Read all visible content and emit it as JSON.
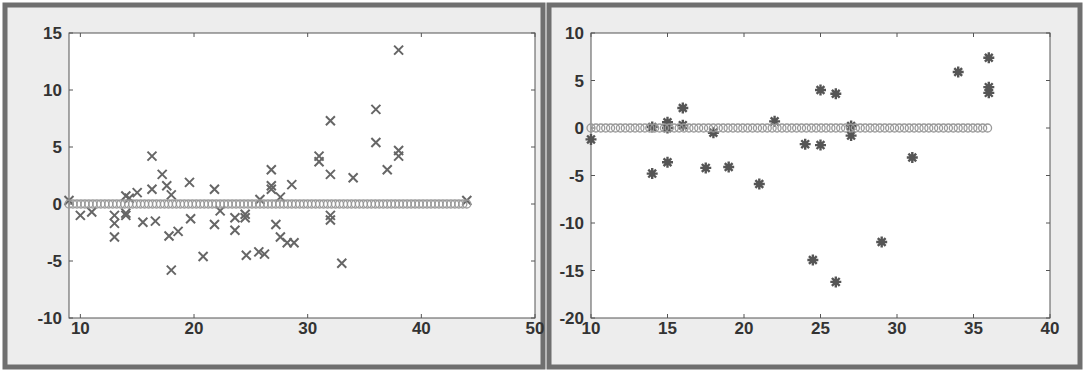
{
  "chart_data": [
    {
      "type": "scatter",
      "title": "",
      "xlabel": "",
      "ylabel": "",
      "xlim": [
        9,
        50
      ],
      "ylim": [
        -10,
        15
      ],
      "xticks": [
        10,
        20,
        30,
        40,
        50
      ],
      "yticks": [
        15,
        10,
        5,
        0,
        -5,
        -10
      ],
      "grid": false,
      "legend": null,
      "series": [
        {
          "name": "residuals",
          "marker": "x",
          "color": "#666666",
          "points": [
            [
              9,
              0.3
            ],
            [
              10,
              -1.0
            ],
            [
              11,
              -0.7
            ],
            [
              13,
              -1.0
            ],
            [
              13,
              -1.7
            ],
            [
              13,
              -2.9
            ],
            [
              14,
              0.7
            ],
            [
              14,
              -0.8
            ],
            [
              14,
              -1.0
            ],
            [
              14.3,
              0.5
            ],
            [
              15,
              1.0
            ],
            [
              15.5,
              -1.6
            ],
            [
              16.3,
              4.2
            ],
            [
              16.3,
              1.3
            ],
            [
              16.6,
              -1.5
            ],
            [
              17.2,
              2.6
            ],
            [
              17.6,
              1.6
            ],
            [
              18,
              0.8
            ],
            [
              17.8,
              -2.8
            ],
            [
              18,
              -5.8
            ],
            [
              18.6,
              -2.4
            ],
            [
              19.6,
              1.9
            ],
            [
              19.7,
              -1.3
            ],
            [
              20.8,
              -4.6
            ],
            [
              21.8,
              1.3
            ],
            [
              21.8,
              -1.8
            ],
            [
              22.3,
              -0.6
            ],
            [
              23.6,
              -1.2
            ],
            [
              23.6,
              -2.3
            ],
            [
              24.5,
              -0.9
            ],
            [
              24.5,
              -1.2
            ],
            [
              24.6,
              -4.5
            ],
            [
              25.8,
              0.4
            ],
            [
              25.7,
              -4.2
            ],
            [
              26.2,
              -4.4
            ],
            [
              26.8,
              3.0
            ],
            [
              26.8,
              1.6
            ],
            [
              26.8,
              1.3
            ],
            [
              27.2,
              -1.8
            ],
            [
              27.6,
              0.6
            ],
            [
              27.6,
              -2.9
            ],
            [
              28.6,
              1.7
            ],
            [
              28.2,
              -3.4
            ],
            [
              28.8,
              -3.4
            ],
            [
              31,
              4.2
            ],
            [
              31,
              3.7
            ],
            [
              32,
              7.3
            ],
            [
              32,
              2.6
            ],
            [
              32,
              -1.0
            ],
            [
              32,
              -1.4
            ],
            [
              33,
              -5.2
            ],
            [
              34,
              2.3
            ],
            [
              36,
              8.3
            ],
            [
              36,
              5.4
            ],
            [
              37,
              3.0
            ],
            [
              38,
              13.5
            ],
            [
              38,
              4.7
            ],
            [
              38,
              4.2
            ],
            [
              44,
              0.3
            ]
          ]
        },
        {
          "name": "baseline",
          "marker": "o",
          "color": "#999999",
          "x_range": [
            9,
            44
          ],
          "y": 0
        }
      ]
    },
    {
      "type": "scatter",
      "title": "",
      "xlabel": "",
      "ylabel": "",
      "xlim": [
        10,
        40
      ],
      "ylim": [
        -20,
        10
      ],
      "xticks": [
        10,
        15,
        20,
        25,
        30,
        35,
        40
      ],
      "yticks": [
        10,
        5,
        0,
        -5,
        -10,
        -15,
        -20
      ],
      "grid": false,
      "legend": null,
      "series": [
        {
          "name": "residuals",
          "marker": "*",
          "color": "#555555",
          "points": [
            [
              10,
              -1.2
            ],
            [
              14,
              -4.8
            ],
            [
              14,
              0.1
            ],
            [
              15,
              0.6
            ],
            [
              15,
              0.0
            ],
            [
              15,
              -3.6
            ],
            [
              16,
              2.1
            ],
            [
              16,
              0.3
            ],
            [
              17.5,
              -4.2
            ],
            [
              18,
              -0.5
            ],
            [
              19,
              -4.1
            ],
            [
              21,
              -5.9
            ],
            [
              22,
              0.7
            ],
            [
              24,
              -1.7
            ],
            [
              24.5,
              -13.9
            ],
            [
              25,
              4.0
            ],
            [
              25,
              -1.8
            ],
            [
              26,
              3.6
            ],
            [
              26,
              -16.2
            ],
            [
              27,
              0.2
            ],
            [
              27,
              -0.8
            ],
            [
              29,
              -12.0
            ],
            [
              31,
              -3.1
            ],
            [
              34,
              5.9
            ],
            [
              36,
              7.4
            ],
            [
              36,
              4.3
            ],
            [
              36,
              3.7
            ]
          ]
        },
        {
          "name": "baseline",
          "marker": "o",
          "color": "#999999",
          "x_range": [
            10,
            36
          ],
          "y": 0
        }
      ]
    }
  ]
}
